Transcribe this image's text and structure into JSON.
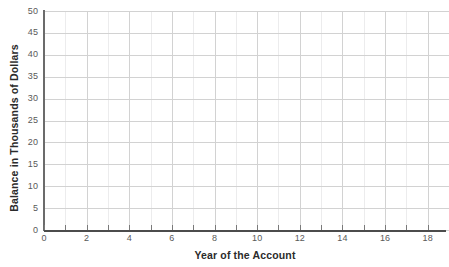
{
  "chart_data": {
    "type": "line",
    "title": "",
    "xlabel": "Year of the Account",
    "ylabel": "Balance in Thousands of Dollars",
    "xlim": [
      0,
      19
    ],
    "ylim": [
      0,
      50
    ],
    "grid": true,
    "legend": "none",
    "series": [],
    "x_ticks": [
      0,
      2,
      4,
      6,
      8,
      10,
      12,
      14,
      16,
      18
    ],
    "x_tick_labels": [
      "0",
      "2",
      "4",
      "6",
      "8",
      "10",
      "12",
      "14",
      "16",
      "18"
    ],
    "x_minor_ticks": [
      1,
      3,
      5,
      7,
      9,
      11,
      13,
      15,
      17,
      19
    ],
    "y_ticks": [
      0,
      5,
      10,
      15,
      20,
      25,
      30,
      35,
      40,
      45,
      50
    ],
    "y_tick_labels": [
      "0",
      "5",
      "10",
      "15",
      "20",
      "25",
      "30",
      "35",
      "40",
      "45",
      "50"
    ],
    "x_major_step": 2,
    "x_minor_step": 1,
    "y_major_step": 5,
    "note": "Empty coordinate grid; no data series plotted."
  },
  "axes": {
    "y_title": "Balance in Thousands of Dollars",
    "x_title": "Year of the Account"
  },
  "colors": {
    "background": "#ffffff",
    "axis_line": "#4c4c4c",
    "major_gridline": "#d2d2d2",
    "minor_gridline": "#ececed",
    "tick_label": "#595959",
    "axis_title": "#2b2b2b"
  },
  "clipped_title": ""
}
